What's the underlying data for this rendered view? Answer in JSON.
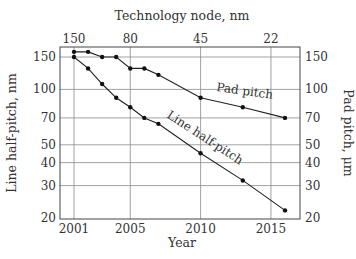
{
  "chart_data": {
    "type": "line",
    "title": "Technology node, nm",
    "xlabel": "Year",
    "ylabel_left": "Line half-pitch, nm",
    "ylabel_right": "Pad pitch, μm",
    "x_ticks": [
      2001,
      2005,
      2010,
      2015
    ],
    "x_range": [
      2000.5,
      2017
    ],
    "top_axis_label": "Technology node, nm",
    "top_ticks": [
      {
        "label": "150",
        "year": 2001
      },
      {
        "label": "80",
        "year": 2005
      },
      {
        "label": "45",
        "year": 2010
      },
      {
        "label": "22",
        "year": 2015
      }
    ],
    "y_scale": "log",
    "y_ticks": [
      20,
      30,
      40,
      50,
      70,
      100,
      150
    ],
    "y_range": [
      20,
      170
    ],
    "grid": true,
    "series": [
      {
        "name": "Pad pitch",
        "axis": "right",
        "x": [
          2001,
          2002,
          2003,
          2004,
          2005,
          2006,
          2007,
          2010,
          2013,
          2016
        ],
        "values": [
          160,
          160,
          150,
          150,
          130,
          130,
          120,
          90,
          80,
          70
        ]
      },
      {
        "name": "Line half-pitch",
        "axis": "left",
        "x": [
          2001,
          2002,
          2003,
          2004,
          2005,
          2006,
          2007,
          2010,
          2013,
          2016
        ],
        "values": [
          150,
          130,
          107,
          90,
          80,
          70,
          65,
          45,
          32,
          22
        ]
      }
    ],
    "annotations": [
      {
        "text": "Pad pitch",
        "near_series": "Pad pitch"
      },
      {
        "text": "Line half-pitch",
        "near_series": "Line half-pitch"
      }
    ]
  },
  "labels": {
    "title": "Technology node, nm",
    "xlabel": "Year",
    "ylabel_left": "Line half-pitch, nm",
    "ylabel_right": "Pad pitch, μm",
    "anno_pad": "Pad pitch",
    "anno_line": "Line half-pitch"
  }
}
